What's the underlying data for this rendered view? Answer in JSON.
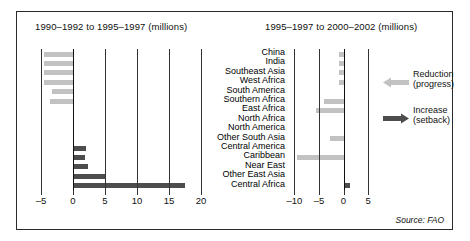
{
  "source_note": "Source: FAO",
  "legend": {
    "reduction": {
      "label_line1": "Reduction",
      "label_line2": "(progress)",
      "color": "#c2c2c2",
      "icon": "arrow-left-icon"
    },
    "increase": {
      "label_line1": "Increase",
      "label_line2": "(setback)",
      "color": "#4d4d4d",
      "icon": "arrow-right-icon"
    }
  },
  "chart_data": [
    {
      "id": "left",
      "type": "bar",
      "orientation": "horizontal",
      "title": "1990–1992 to 1995–1997 (millions)",
      "xlabel": "",
      "ylabel": "",
      "xlim": [
        -5,
        20
      ],
      "xticks": [
        -5,
        0,
        5,
        10,
        15,
        20
      ],
      "xticklabels": [
        "–5",
        "0",
        "5",
        "10",
        "15",
        "20"
      ],
      "grid": true,
      "categories": [
        "China",
        "India",
        "Southeast Asia",
        "West Africa",
        "South America",
        "Southern Africa",
        "East Africa",
        "North Africa",
        "North America",
        "Other South Asia",
        "Central America",
        "Caribbean",
        "Near East",
        "Other East Asia",
        "Central Africa"
      ],
      "values": [
        -4.6,
        -4.6,
        -4.6,
        -4.6,
        -3.3,
        -3.6,
        0,
        0,
        0,
        0,
        2.0,
        1.9,
        2.3,
        5.1,
        17.5
      ]
    },
    {
      "id": "right",
      "type": "bar",
      "orientation": "horizontal",
      "title": "1995–1997 to 2000–2002 (millions)",
      "xlabel": "",
      "ylabel": "",
      "xlim": [
        -11.5,
        6
      ],
      "xticks": [
        -10,
        -5,
        0,
        5
      ],
      "xticklabels": [
        "–10",
        "–5",
        "0",
        "5"
      ],
      "grid": true,
      "categories": [
        "China",
        "India",
        "Southeast Asia",
        "West Africa",
        "South America",
        "Southern Africa",
        "East Africa",
        "North Africa",
        "North America",
        "Other South Asia",
        "Central America",
        "Caribbean",
        "Near East",
        "Other East Asia",
        "Central Africa"
      ],
      "values": [
        -0.9,
        -0.9,
        -0.9,
        -0.9,
        0,
        -4.0,
        -5.6,
        0,
        0,
        -2.7,
        0,
        -9.5,
        0,
        0,
        1.3
      ]
    }
  ]
}
